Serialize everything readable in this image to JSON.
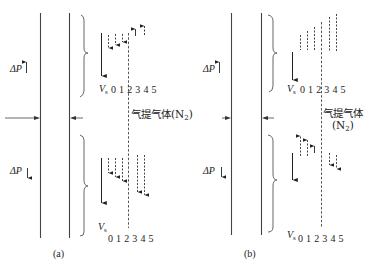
{
  "figure": {
    "panels": [
      {
        "id": "a",
        "caption": "(a)",
        "upper": {
          "pressure_label": "ΔP",
          "pressure_direction": "up",
          "velocity_label": "V",
          "velocity_sub": "s",
          "ticks": "0 1 2 3 4 5",
          "arrows_description": "positions 1-3 downward dashed arrows, positions 4-5 upward short arrows"
        },
        "lower": {
          "pressure_label": "ΔP",
          "pressure_direction": "down",
          "velocity_label": "V",
          "velocity_sub": "s",
          "ticks": "0 1 2 3 4 5",
          "arrows_description": "all positions 1-5 downward dashed arrows, longer at 4-5"
        },
        "gas_label": "气提气体",
        "gas_formula": "N",
        "gas_sub": "2"
      },
      {
        "id": "b",
        "caption": "(b)",
        "upper": {
          "pressure_label": "ΔP",
          "pressure_direction": "up",
          "velocity_label": "V",
          "velocity_sub": "s",
          "ticks": "0 1 2 3 4 5",
          "arrows_description": "dashed vertical segments without arrowheads, increasing height from positions 1 to 5"
        },
        "lower": {
          "pressure_label": "ΔP",
          "pressure_direction": "down",
          "velocity_label": "V",
          "velocity_sub": "s",
          "ticks": "0 1 2 3 4 5",
          "arrows_description": "positions 1-3 upward dashed arrows, positions 4-5 downward dashed arrows"
        },
        "gas_label": "气提气体",
        "gas_formula": "N",
        "gas_sub": "2"
      }
    ]
  }
}
